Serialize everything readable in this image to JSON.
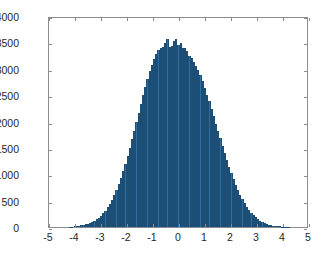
{
  "chart_data": {
    "type": "bar",
    "title": "",
    "subtitle": "",
    "xlabel": "",
    "ylabel": "",
    "xlim": [
      -5,
      5
    ],
    "ylim": [
      0,
      4000
    ],
    "grid": false,
    "legend": null,
    "style": "matlab-histogram",
    "bar_color": "#2e6da4",
    "edge_color": "#1d4f76",
    "axis_color": "#8d8d8d",
    "text_color": "#262626",
    "background": "#ffffff",
    "xticks": [
      -5,
      -4,
      -3,
      -2,
      -1,
      0,
      1,
      2,
      3,
      4,
      5
    ],
    "xtick_labels": [
      "-5",
      "-4",
      "-3",
      "-2",
      "-1",
      "0",
      "1",
      "2",
      "3",
      "4",
      "5"
    ],
    "yticks": [
      0,
      500,
      1000,
      1500,
      2000,
      2500,
      3000,
      3500,
      4000
    ],
    "ytick_labels": [
      "0",
      "500",
      "1000",
      "1500",
      "2000",
      "2500",
      "3000",
      "3500",
      "4000"
    ],
    "bin_width": 0.085,
    "n_bins": 100,
    "distribution": "normal",
    "mean": 0.05,
    "std": 1.0,
    "peak_value": 3560,
    "bin_centers": [
      -4.185,
      -4.1,
      -4.015,
      -3.93,
      -3.845,
      -3.76,
      -3.675,
      -3.59,
      -3.505,
      -3.42,
      -3.335,
      -3.25,
      -3.165,
      -3.08,
      -2.995,
      -2.91,
      -2.825,
      -2.74,
      -2.655,
      -2.57,
      -2.485,
      -2.4,
      -2.315,
      -2.23,
      -2.145,
      -2.06,
      -1.975,
      -1.89,
      -1.805,
      -1.72,
      -1.635,
      -1.55,
      -1.465,
      -1.38,
      -1.295,
      -1.21,
      -1.125,
      -1.04,
      -0.955,
      -0.87,
      -0.785,
      -0.7,
      -0.615,
      -0.53,
      -0.445,
      -0.36,
      -0.275,
      -0.19,
      -0.105,
      -0.02,
      0.065,
      0.15,
      0.235,
      0.32,
      0.405,
      0.49,
      0.575,
      0.66,
      0.745,
      0.83,
      0.915,
      1.0,
      1.085,
      1.17,
      1.255,
      1.34,
      1.425,
      1.51,
      1.595,
      1.68,
      1.765,
      1.85,
      1.935,
      2.02,
      2.105,
      2.19,
      2.275,
      2.36,
      2.445,
      2.53,
      2.615,
      2.7,
      2.785,
      2.87,
      2.955,
      3.04,
      3.125,
      3.21,
      3.295,
      3.38,
      3.465,
      3.55,
      3.635,
      3.72,
      3.805,
      3.89,
      3.975,
      4.06,
      4.145,
      4.23
    ],
    "counts": [
      6,
      8,
      12,
      16,
      22,
      30,
      38,
      48,
      62,
      78,
      96,
      118,
      145,
      178,
      215,
      258,
      310,
      370,
      438,
      515,
      600,
      700,
      810,
      930,
      1060,
      1200,
      1350,
      1500,
      1660,
      1820,
      1990,
      2160,
      2330,
      2500,
      2660,
      2810,
      2950,
      3080,
      3190,
      3280,
      3350,
      3395,
      3420,
      3480,
      3560,
      3420,
      3440,
      3520,
      3560,
      3450,
      3480,
      3400,
      3390,
      3330,
      3250,
      3200,
      3130,
      3060,
      2970,
      2880,
      2770,
      2640,
      2510,
      2380,
      2240,
      2100,
      1960,
      1820,
      1680,
      1540,
      1400,
      1270,
      1145,
      1025,
      910,
      805,
      706,
      614,
      530,
      455,
      386,
      325,
      272,
      225,
      185,
      150,
      121,
      97,
      77,
      60,
      47,
      36,
      27,
      21,
      16,
      12,
      9,
      7,
      5,
      4
    ]
  }
}
